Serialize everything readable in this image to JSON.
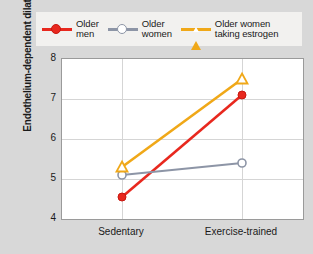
{
  "chart_data": {
    "type": "line",
    "title": "",
    "xlabel": "",
    "ylabel": "Endothelium-dependent dilation (%)",
    "categories": [
      "Sedentary",
      "Exercise-trained"
    ],
    "ylim": [
      4,
      8
    ],
    "yticks": [
      4,
      5,
      6,
      7,
      8
    ],
    "grid": true,
    "legend_position": "top",
    "series": [
      {
        "name": "Older men",
        "label_lines": "Older\nmen",
        "color": "#e8281e",
        "marker": "filled-circle",
        "values": [
          4.55,
          7.1
        ]
      },
      {
        "name": "Older women",
        "label_lines": "Older\nwomen",
        "color": "#8d95a6",
        "marker": "open-circle",
        "values": [
          5.1,
          5.4
        ]
      },
      {
        "name": "Older women taking estrogen",
        "label_lines": "Older women\ntaking estrogen",
        "color": "#f0a818",
        "marker": "open-triangle",
        "values": [
          5.3,
          7.5
        ]
      }
    ]
  },
  "axis": {
    "ytick_labels": [
      "8",
      "7",
      "6",
      "5",
      "4"
    ],
    "xtick_labels": [
      "Sedentary",
      "Exercise-trained"
    ]
  }
}
